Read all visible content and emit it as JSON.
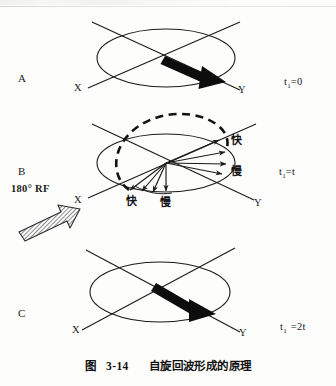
{
  "figure": {
    "caption_label": "图",
    "caption_number": "3-14",
    "caption_title": "自旋回波形成的原理",
    "background_color": "#fdfdfc",
    "ink_color": "#1a1a1a"
  },
  "panels": [
    {
      "letter": "A",
      "time_label": "t",
      "time_sub": "1",
      "time_value": "=0",
      "axis_x": "X",
      "axis_y": "Y",
      "vector_description": "single thick black magnetization vector pointing toward Y"
    },
    {
      "letter": "B",
      "time_label": "t",
      "time_sub": "1",
      "time_value": "=t",
      "axis_x": "X",
      "axis_y": "Y",
      "rf_label": "180° RF",
      "fast_label_right": "快",
      "slow_label_right": "慢",
      "fast_label_bottom": "快",
      "slow_label_bottom": "慢",
      "vector_description": "fan of dephasing spin vectors with dashed arc"
    },
    {
      "letter": "C",
      "time_label": "t",
      "time_sub": "1",
      "time_value": "=2t",
      "axis_x": "X",
      "axis_y": "Y",
      "vector_description": "single thick black rephased magnetization vector toward Y"
    }
  ]
}
